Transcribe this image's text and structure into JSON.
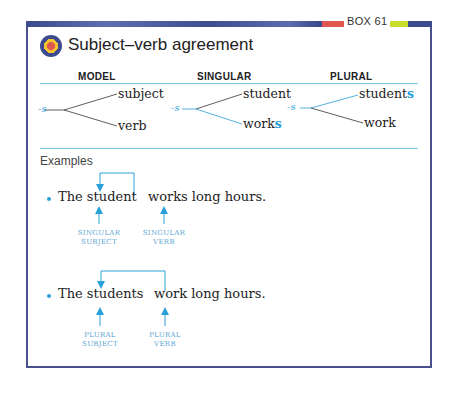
{
  "header": {
    "box_label": "BOX 61",
    "title": "Subject–verb agreement",
    "logo_icon": "target-icon"
  },
  "columns": {
    "model": "MODEL",
    "singular": "SINGULAR",
    "plural": "PLURAL"
  },
  "diagrams": {
    "model": {
      "suffix": "-s",
      "top": "subject",
      "bottom": "verb"
    },
    "singular": {
      "suffix": "-s",
      "top": "student",
      "bottom_base": "work",
      "bottom_suffix": "s"
    },
    "plural": {
      "suffix": "-s",
      "top_base": "student",
      "top_suffix": "s",
      "bottom": "work"
    }
  },
  "examples": {
    "heading": "Examples",
    "items": [
      {
        "subject": "The student",
        "predicate": "works long hours.",
        "subject_label_1": "SINGULAR",
        "subject_label_2": "SUBJECT",
        "verb_label_1": "SINGULAR",
        "verb_label_2": "VERB"
      },
      {
        "subject": "The students",
        "predicate": "work long hours.",
        "subject_label_1": "PLURAL",
        "subject_label_2": "SUBJECT",
        "verb_label_1": "PLURAL",
        "verb_label_2": "VERB"
      }
    ]
  },
  "colors": {
    "frame": "#4a4f8e",
    "accent_blue": "#2aa0d8",
    "rule_blue": "#7fc4e2",
    "red": "#e0584f",
    "yellow": "#c8dc2a"
  }
}
